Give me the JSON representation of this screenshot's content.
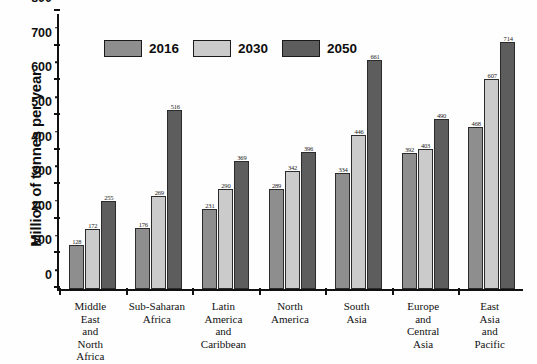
{
  "chart_data": {
    "type": "bar",
    "title": "",
    "xlabel": "",
    "ylabel": "Million of tonnes per year",
    "ylim": [
      0,
      800
    ],
    "ytick_step": 100,
    "yticks": [
      "0",
      "100",
      "200",
      "300",
      "400",
      "500",
      "600",
      "700",
      "800"
    ],
    "grid": false,
    "legend_position": "top-left-inside",
    "categories": [
      "Middle East and North Africa",
      "Sub-Saharan Africa",
      "Latin America and Caribbean",
      "North America",
      "South Asia",
      "Europe and Central Asia",
      "East Asia and Pacific"
    ],
    "category_lines": [
      [
        "Middle",
        "East",
        "and",
        "North",
        "Africa"
      ],
      [
        "Sub-Saharan",
        "Africa"
      ],
      [
        "Latin",
        "America",
        "and",
        "Caribbean"
      ],
      [
        "North",
        "America"
      ],
      [
        "South",
        "Asia"
      ],
      [
        "Europe",
        "and",
        "Central",
        "Asia"
      ],
      [
        "East",
        "Asia",
        "and",
        "Pacific"
      ]
    ],
    "series": [
      {
        "name": "2016",
        "color": "#8e8e8e",
        "values": [
          128,
          176,
          231,
          289,
          334,
          392,
          468
        ]
      },
      {
        "name": "2030",
        "color": "#cbcbcb",
        "values": [
          172,
          269,
          290,
          342,
          446,
          403,
          607
        ]
      },
      {
        "name": "2050",
        "color": "#5d5d5d",
        "values": [
          255,
          516,
          369,
          396,
          661,
          490,
          714
        ]
      }
    ]
  },
  "legend": {
    "items": [
      {
        "label": "2016",
        "color": "#8e8e8e"
      },
      {
        "label": "2030",
        "color": "#cbcbcb"
      },
      {
        "label": "2050",
        "color": "#5d5d5d"
      }
    ]
  }
}
